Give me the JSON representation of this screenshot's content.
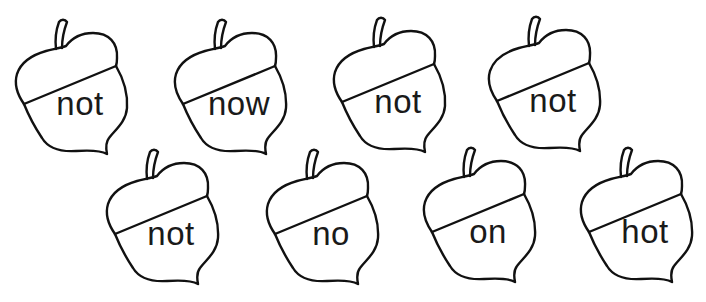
{
  "worksheet": {
    "colors": {
      "background": "#ffffff",
      "outline": "#111111",
      "text": "#1a1a1a"
    },
    "acorns": [
      {
        "word": "not",
        "x": 0,
        "y": 0
      },
      {
        "word": "now",
        "x": 159,
        "y": 0
      },
      {
        "word": "not",
        "x": 318,
        "y": -2
      },
      {
        "word": "not",
        "x": 473,
        "y": -3
      },
      {
        "word": "not",
        "x": 91,
        "y": 130
      },
      {
        "word": "no",
        "x": 251,
        "y": 130
      },
      {
        "word": "on",
        "x": 408,
        "y": 128
      },
      {
        "word": "hot",
        "x": 565,
        "y": 128
      }
    ]
  }
}
